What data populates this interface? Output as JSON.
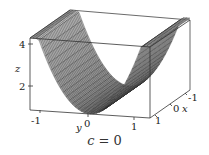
{
  "chart_data": {
    "type": "surface3d",
    "title": "",
    "caption": "c = 0",
    "caption_var": "c",
    "caption_value": "0",
    "xlabel": "x",
    "ylabel": "y",
    "zlabel": "z",
    "x_ticks": [
      "-1",
      "0",
      "1"
    ],
    "y_ticks": [
      "-1",
      "0",
      "1"
    ],
    "z_ticks": [
      "2",
      "4"
    ],
    "xlim": [
      -1,
      1
    ],
    "ylim": [
      -1.2,
      1.2
    ],
    "zlim": [
      1,
      4.2
    ],
    "surface": "z = 1 + 3*y^2 (independent of x), U-shaped trough",
    "grid": false,
    "box": true
  }
}
